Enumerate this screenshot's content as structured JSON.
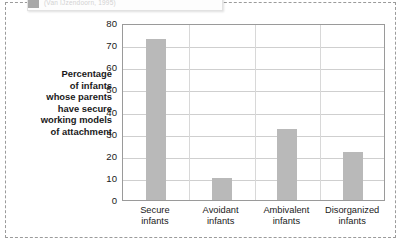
{
  "caption": {
    "text": "(Van IJzendoorn, 1995)"
  },
  "axis_title_lines": [
    "Percentage",
    "of infants",
    "whose parents",
    "have secure",
    "working models",
    "of attachment"
  ],
  "colors": {
    "bar": "#b9b9b9",
    "gridline": "#cfcfcf",
    "plot_border": "#9a9a9a",
    "frame": "#9b9b9b",
    "text": "#1a1a1a"
  },
  "chart_data": {
    "type": "bar",
    "title": "",
    "xlabel": "",
    "ylabel": "Percentage of infants whose parents have secure working models of attachment",
    "categories": [
      "Secure infants",
      "Avoidant infants",
      "Ambivalent infants",
      "Disorganized infants"
    ],
    "category_lines": [
      [
        "Secure",
        "infants"
      ],
      [
        "Avoidant",
        "infants"
      ],
      [
        "Ambivalent",
        "infants"
      ],
      [
        "Disorganized",
        "infants"
      ]
    ],
    "values": [
      73,
      10,
      32,
      21.5
    ],
    "ylim": [
      0,
      80
    ],
    "yticks": [
      0,
      10,
      20,
      30,
      40,
      50,
      60,
      70,
      80
    ],
    "ytick_labels": [
      "0",
      "10",
      "20",
      "30",
      "40",
      "50",
      "60",
      "70",
      "80"
    ],
    "grid": true,
    "legend": "none"
  }
}
